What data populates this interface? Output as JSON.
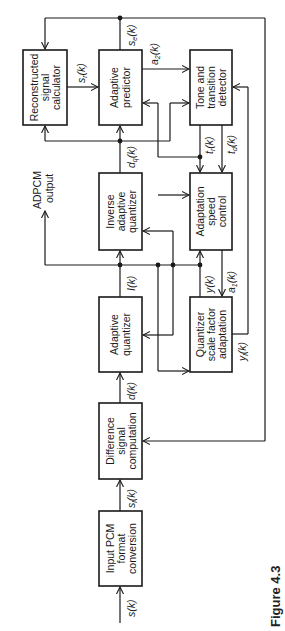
{
  "figure": {
    "caption": "Figure 4.3"
  },
  "blocks": {
    "input_pcm": [
      "Input PCM",
      "format",
      "conversion"
    ],
    "difference": [
      "Difference",
      "signal",
      "computation"
    ],
    "adaptive_quantizer": [
      "Adaptive",
      "quantizer"
    ],
    "inverse_quantizer": [
      "Inverse",
      "adaptive",
      "quantizer"
    ],
    "adaptive_predictor": [
      "Adaptive",
      "predictor"
    ],
    "reconstructed": [
      "Reconstructed",
      "signal",
      "calculator"
    ],
    "tone_detector": [
      "Tone and",
      "transition",
      "detector"
    ],
    "speed_control": [
      "Adaptation",
      "speed",
      "control"
    ],
    "scale_factor": [
      "Quantizer",
      "scale factor",
      "adaptation"
    ]
  },
  "signals": {
    "s": "s(k)",
    "sl": "s",
    "sl_sub": "l",
    "sl_tail": "(k)",
    "d": "d(k)",
    "I": "I(k)",
    "dq": "d",
    "dq_sub": "q",
    "dq_tail": "(k)",
    "sr": "s",
    "sr_sub": "r",
    "sr_tail": "(k)",
    "se": "s",
    "se_sub": "e",
    "se_tail": "(k)",
    "a2": "a",
    "a2_sub": "2",
    "a2_tail": "(k)",
    "tr": "t",
    "tr_sub": "r",
    "tr_tail": "(k)",
    "td": "t",
    "td_sub": "d",
    "td_tail": "(k)",
    "y": "y(k)",
    "a1": "a",
    "a1_sub": "1",
    "a1_tail": "(k)",
    "yl": "y",
    "yl_sub": "l",
    "yl_tail": "(k)"
  },
  "output": {
    "label_line1": "ADPCM",
    "label_line2": "output"
  }
}
